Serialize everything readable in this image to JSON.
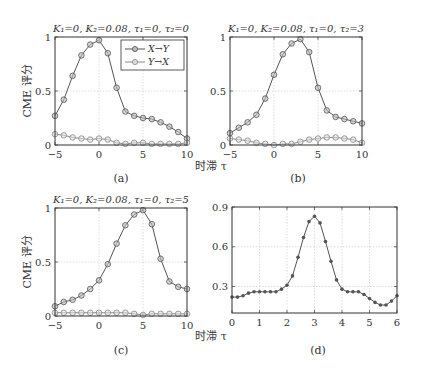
{
  "figure": {
    "shared_xlabel": "时滞 τ",
    "shared_ylabel": "CME 评分",
    "legend": [
      "X→Y",
      "Y→X"
    ]
  },
  "chart_data": [
    {
      "id": "a",
      "type": "line",
      "caption": "(a)",
      "title": "K₁=0, K₂=0.08, τ₁=0, τ₂=0",
      "xlabel": "时滞 τ",
      "ylabel": "CME 评分",
      "xlim": [
        -5,
        10
      ],
      "ylim": [
        0,
        1
      ],
      "xticks": [
        -5,
        0,
        5,
        10
      ],
      "yticks": [
        0,
        0.5,
        1
      ],
      "ytick_labels": [
        "0",
        "0.5",
        "1"
      ],
      "grid": true,
      "legend_position": "upper right",
      "x": [
        -5,
        -4,
        -3,
        -2,
        -1,
        0,
        1,
        2,
        3,
        4,
        5,
        6,
        7,
        8,
        9,
        10
      ],
      "series": [
        {
          "name": "X→Y",
          "marker": "circle",
          "values": [
            0.27,
            0.42,
            0.64,
            0.83,
            0.93,
            0.97,
            0.85,
            0.53,
            0.31,
            0.27,
            0.25,
            0.24,
            0.21,
            0.17,
            0.12,
            0.06
          ]
        },
        {
          "name": "Y→X",
          "marker": "circle",
          "values": [
            0.1,
            0.09,
            0.07,
            0.06,
            0.05,
            0.06,
            0.05,
            0.02,
            0.01,
            0.02,
            0.02,
            0.01,
            0.01,
            0.01,
            0.01,
            0.02
          ]
        }
      ]
    },
    {
      "id": "b",
      "type": "line",
      "caption": "(b)",
      "title": "K₁=0, K₂=0.08, τ₁=0, τ₂=3",
      "xlim": [
        -5,
        10
      ],
      "ylim": [
        0,
        1
      ],
      "xticks": [
        -5,
        0,
        5,
        10
      ],
      "yticks": [
        0,
        0.5,
        1
      ],
      "ytick_labels": [
        "0",
        "0.5",
        "1"
      ],
      "grid": true,
      "x": [
        -5,
        -4,
        -3,
        -2,
        -1,
        0,
        1,
        2,
        3,
        4,
        5,
        6,
        7,
        8,
        9,
        10
      ],
      "series": [
        {
          "name": "X→Y",
          "marker": "circle",
          "values": [
            0.11,
            0.16,
            0.21,
            0.28,
            0.43,
            0.65,
            0.84,
            0.94,
            0.98,
            0.86,
            0.53,
            0.32,
            0.26,
            0.24,
            0.22,
            0.2
          ]
        },
        {
          "name": "Y→X",
          "marker": "circle",
          "values": [
            0.06,
            0.05,
            0.04,
            0.02,
            0.01,
            0.0,
            0.01,
            0.01,
            0.03,
            0.05,
            0.06,
            0.07,
            0.07,
            0.06,
            0.05,
            0.02
          ]
        }
      ]
    },
    {
      "id": "c",
      "type": "line",
      "caption": "(c)",
      "title": "K₁=0, K₂=0.08, τ₁=0, τ₂=5",
      "xlabel": "时滞 τ",
      "ylabel": "CME 评分",
      "xlim": [
        -5,
        10
      ],
      "ylim": [
        0,
        1
      ],
      "xticks": [
        -5,
        0,
        5,
        10
      ],
      "yticks": [
        0,
        0.5,
        1
      ],
      "ytick_labels": [
        "0",
        "0.5",
        "1"
      ],
      "grid": true,
      "x": [
        -5,
        -4,
        -3,
        -2,
        -1,
        0,
        1,
        2,
        3,
        4,
        5,
        6,
        7,
        8,
        9,
        10
      ],
      "series": [
        {
          "name": "X→Y",
          "marker": "circle",
          "values": [
            0.09,
            0.13,
            0.15,
            0.19,
            0.25,
            0.33,
            0.48,
            0.67,
            0.84,
            0.94,
            0.98,
            0.85,
            0.53,
            0.32,
            0.27,
            0.25
          ]
        },
        {
          "name": "Y→X",
          "marker": "circle",
          "values": [
            0.03,
            0.03,
            0.03,
            0.03,
            0.03,
            0.03,
            0.03,
            0.03,
            0.03,
            0.02,
            0.01,
            0.02,
            0.02,
            0.02,
            0.02,
            0.02
          ]
        }
      ]
    },
    {
      "id": "d",
      "type": "line",
      "caption": "(d)",
      "title": "",
      "xlim": [
        0,
        6
      ],
      "ylim": [
        0.1,
        0.9
      ],
      "xticks": [
        0,
        1,
        2,
        3,
        4,
        5,
        6
      ],
      "yticks": [
        0.3,
        0.6,
        0.9
      ],
      "ytick_labels": [
        "0.3",
        "0.6",
        "0.9"
      ],
      "grid": true,
      "x": [
        0,
        0.2,
        0.4,
        0.6,
        0.8,
        1.0,
        1.2,
        1.4,
        1.6,
        1.8,
        2.0,
        2.2,
        2.4,
        2.6,
        2.8,
        3.0,
        3.2,
        3.4,
        3.6,
        3.8,
        4.0,
        4.2,
        4.4,
        4.6,
        4.8,
        5.0,
        5.2,
        5.4,
        5.6,
        5.8,
        6.0
      ],
      "series": [
        {
          "name": "",
          "marker": "dot",
          "values": [
            0.22,
            0.22,
            0.23,
            0.25,
            0.26,
            0.26,
            0.26,
            0.26,
            0.26,
            0.28,
            0.31,
            0.38,
            0.52,
            0.67,
            0.79,
            0.83,
            0.78,
            0.64,
            0.49,
            0.35,
            0.28,
            0.26,
            0.26,
            0.26,
            0.24,
            0.21,
            0.18,
            0.16,
            0.16,
            0.19,
            0.23
          ]
        }
      ]
    }
  ],
  "layout": {
    "panels": {
      "a": {
        "left": 55,
        "right": 187,
        "top": 37,
        "bottom": 145
      },
      "b": {
        "left": 230,
        "right": 362,
        "top": 37,
        "bottom": 145
      },
      "c": {
        "left": 55,
        "right": 187,
        "top": 208,
        "bottom": 316
      },
      "d": {
        "left": 232,
        "right": 397,
        "top": 207,
        "bottom": 313
      }
    }
  }
}
